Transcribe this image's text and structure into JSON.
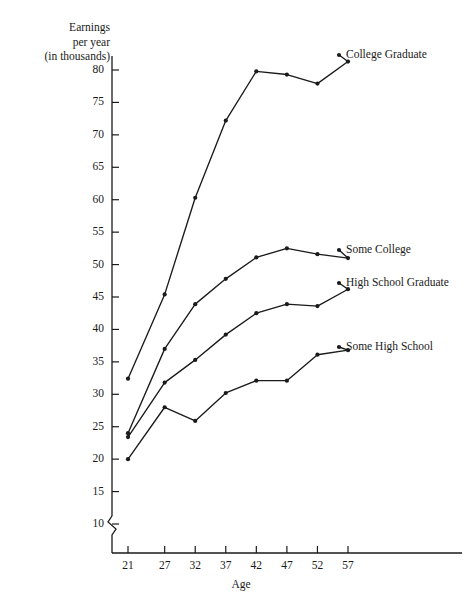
{
  "chart_data": {
    "type": "line",
    "title": "",
    "ylabel_lines": [
      "Earnings",
      "per year",
      "(in thousands)"
    ],
    "xlabel": "Age",
    "x": [
      21,
      27,
      32,
      37,
      42,
      47,
      52,
      57
    ],
    "xtick_labels": [
      "21",
      "27",
      "32",
      "37",
      "42",
      "47",
      "52",
      "57"
    ],
    "ytick_labels": [
      "10",
      "15",
      "20",
      "25",
      "30",
      "35",
      "40",
      "45",
      "50",
      "55",
      "60",
      "65",
      "70",
      "75",
      "80"
    ],
    "yticks": [
      10,
      15,
      20,
      25,
      30,
      35,
      40,
      45,
      50,
      55,
      60,
      65,
      70,
      75,
      80
    ],
    "ylim": [
      10,
      80
    ],
    "xlim": [
      21,
      57
    ],
    "axis_break": true,
    "grid": false,
    "legend_position": "right-inline",
    "marker": "filled-circle",
    "line_color": "#1a1a1a",
    "series": [
      {
        "name": "College Graduate",
        "values": [
          32.4,
          45.4,
          60.3,
          72.2,
          79.8,
          79.3,
          77.9,
          81.3
        ],
        "label_y": 55
      },
      {
        "name": "Some College",
        "values": [
          24.0,
          37.0,
          43.9,
          47.8,
          51.1,
          52.5,
          51.6,
          51.0
        ],
        "label_y": 250
      },
      {
        "name": "High School Graduate",
        "values": [
          23.4,
          31.8,
          35.3,
          39.2,
          42.5,
          43.9,
          43.6,
          46.2
        ],
        "label_y": 283
      },
      {
        "name": "Some High School",
        "values": [
          20.0,
          28.0,
          25.9,
          30.2,
          32.1,
          32.1,
          36.1,
          36.8
        ],
        "label_y": 347
      }
    ]
  }
}
